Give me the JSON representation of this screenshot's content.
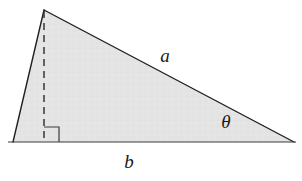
{
  "figure": {
    "kind": "geometry-diagram",
    "shape": "right-triangle",
    "background_color": "#ffffff",
    "fill_color": "#e4e4e4",
    "stroke_color": "#1f1f1f",
    "dashed_stroke_color": "#2b2b2b",
    "labels": {
      "hypotenuse": "a",
      "base": "b",
      "angle": "θ"
    },
    "geometry": {
      "apex": [
        44,
        10
      ],
      "bottom_left": [
        13,
        142
      ],
      "bottom_right": [
        294,
        142
      ],
      "altitude_foot": [
        44,
        142
      ],
      "baseline_left": [
        8,
        142
      ],
      "baseline_right": [
        296,
        142
      ],
      "right_angle_box": [
        44,
        127,
        15,
        15
      ],
      "label_a_pos": [
        165,
        58
      ],
      "label_b_pos": [
        129,
        163
      ],
      "label_theta_pos": [
        226,
        124
      ]
    }
  }
}
